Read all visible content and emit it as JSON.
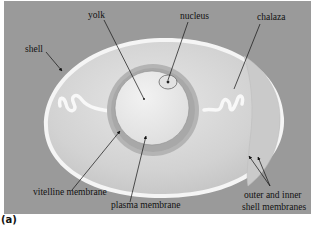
{
  "figure": {
    "panel_label": "(a)",
    "colors": {
      "background": "#9a9a9a",
      "albumen": "#d6d6d6",
      "yolk_ring": "#b8b8b8",
      "yolk": "#e8e8e8",
      "shell": "#f4f4f4"
    },
    "labels": {
      "yolk": "yolk",
      "nucleus": "nucleus",
      "chalaza": "chalaza",
      "shell": "shell",
      "vitelline_membrane": "vitelline membrane",
      "plasma_membrane": "plasma membrane",
      "shell_membranes_line1": "outer and inner",
      "shell_membranes_line2": "shell membranes"
    }
  }
}
